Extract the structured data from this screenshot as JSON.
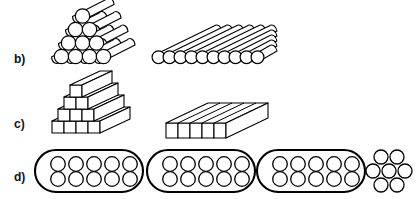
{
  "figure": {
    "background_color": "#ffffff",
    "line_color": "#000000",
    "width": 417,
    "height": 199
  },
  "rows": [
    {
      "id": "b",
      "label": "b)",
      "description": "Cylindrical rods: triangular stacked bundle versus single flat layer",
      "figures": [
        {
          "name": "cylinder-pyramid-stack",
          "shape": "cylinder",
          "arrangement": "triangular-pyramid",
          "layers": [
            4,
            3,
            2,
            1
          ],
          "total_count": 10
        },
        {
          "name": "cylinder-flat-layer",
          "shape": "cylinder",
          "arrangement": "single-flat-layer",
          "layers": [
            10
          ],
          "total_count": 10
        }
      ]
    },
    {
      "id": "c",
      "label": "c)",
      "description": "Square prismatic bars: stepped stacked bundle versus single flat slab",
      "figures": [
        {
          "name": "prism-pyramid-stack",
          "shape": "square-prism",
          "arrangement": "stepped-pyramid",
          "layers": [
            4,
            3,
            2,
            1
          ],
          "total_count": 10
        },
        {
          "name": "prism-flat-slab",
          "shape": "square-prism",
          "arrangement": "single-flat-layer",
          "layers": [
            5
          ],
          "total_count": 5
        }
      ]
    },
    {
      "id": "d",
      "label": "d)",
      "description": "Capsule containers holding circular elements plus one loose cluster",
      "figures": [
        {
          "name": "capsule-container-1",
          "shape": "capsule",
          "arrangement": "grid",
          "rows": 2,
          "columns": 5,
          "total_count": 10
        },
        {
          "name": "capsule-container-2",
          "shape": "capsule",
          "arrangement": "grid",
          "rows": 2,
          "columns": 5,
          "total_count": 10
        },
        {
          "name": "capsule-container-3",
          "shape": "capsule",
          "arrangement": "grid",
          "rows": 2,
          "columns": 5,
          "total_count": 10
        },
        {
          "name": "loose-circle-cluster",
          "shape": "circle",
          "arrangement": "hexagonal-cluster",
          "layers": [
            2,
            3,
            2
          ],
          "total_count": 7
        }
      ]
    }
  ]
}
